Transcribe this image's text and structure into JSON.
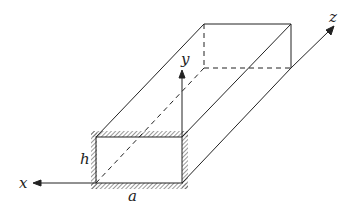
{
  "diagram": {
    "labels": {
      "x_axis": "x",
      "y_axis": "y",
      "z_axis": "z",
      "height": "h",
      "width": "a"
    },
    "colors": {
      "stroke": "#222222",
      "hatch": "#555555",
      "background": "#ffffff"
    }
  }
}
